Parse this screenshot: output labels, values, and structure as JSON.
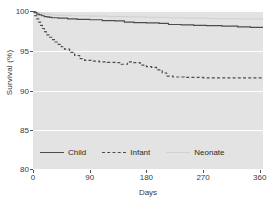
{
  "chart_data": {
    "type": "line",
    "title": "",
    "xlabel": "Days",
    "ylabel": "Survival (%)",
    "xlim": [
      0,
      365
    ],
    "ylim": [
      80,
      100
    ],
    "xticks": [
      0,
      90,
      180,
      270,
      360
    ],
    "yticks": [
      80,
      85,
      90,
      95,
      100
    ],
    "grid": true,
    "legend_position": "inside-bottom-left",
    "series": [
      {
        "name": "Child",
        "style": "solid",
        "color": "#4d4d4d",
        "points": [
          [
            0,
            100.0
          ],
          [
            3,
            99.8
          ],
          [
            6,
            99.6
          ],
          [
            10,
            99.5
          ],
          [
            14,
            99.4
          ],
          [
            18,
            99.3
          ],
          [
            22,
            99.25
          ],
          [
            26,
            99.2
          ],
          [
            30,
            99.15
          ],
          [
            40,
            99.1
          ],
          [
            55,
            99.0
          ],
          [
            70,
            98.95
          ],
          [
            90,
            98.9
          ],
          [
            110,
            98.8
          ],
          [
            130,
            98.75
          ],
          [
            145,
            98.6
          ],
          [
            160,
            98.55
          ],
          [
            180,
            98.5
          ],
          [
            200,
            98.45
          ],
          [
            215,
            98.3
          ],
          [
            235,
            98.25
          ],
          [
            255,
            98.2
          ],
          [
            275,
            98.15
          ],
          [
            300,
            98.1
          ],
          [
            325,
            98.0
          ],
          [
            345,
            97.95
          ],
          [
            365,
            97.9
          ]
        ]
      },
      {
        "name": "Infant",
        "style": "dashed",
        "color": "#4d4d4d",
        "points": [
          [
            0,
            99.9
          ],
          [
            3,
            99.4
          ],
          [
            6,
            99.0
          ],
          [
            9,
            98.6
          ],
          [
            12,
            98.2
          ],
          [
            15,
            97.8
          ],
          [
            18,
            97.4
          ],
          [
            21,
            97.0
          ],
          [
            25,
            96.7
          ],
          [
            30,
            96.4
          ],
          [
            35,
            96.1
          ],
          [
            40,
            95.8
          ],
          [
            45,
            95.5
          ],
          [
            50,
            95.2
          ],
          [
            58,
            94.8
          ],
          [
            66,
            94.4
          ],
          [
            74,
            94.0
          ],
          [
            82,
            93.8
          ],
          [
            92,
            93.7
          ],
          [
            105,
            93.6
          ],
          [
            118,
            93.55
          ],
          [
            130,
            93.5
          ],
          [
            140,
            93.3
          ],
          [
            150,
            93.6
          ],
          [
            160,
            93.5
          ],
          [
            170,
            93.2
          ],
          [
            180,
            93.0
          ],
          [
            188,
            92.9
          ],
          [
            196,
            92.6
          ],
          [
            205,
            92.2
          ],
          [
            212,
            91.8
          ],
          [
            222,
            91.7
          ],
          [
            240,
            91.65
          ],
          [
            270,
            91.6
          ],
          [
            300,
            91.6
          ],
          [
            330,
            91.6
          ],
          [
            365,
            91.6
          ]
        ]
      },
      {
        "name": "Neonate",
        "style": "solid",
        "color": "#d2d2d2",
        "points": [
          [
            0,
            100.0
          ],
          [
            4,
            99.9
          ],
          [
            8,
            99.8
          ],
          [
            14,
            99.7
          ],
          [
            20,
            99.6
          ],
          [
            28,
            99.5
          ],
          [
            40,
            99.45
          ],
          [
            60,
            99.4
          ],
          [
            90,
            99.35
          ],
          [
            120,
            99.3
          ],
          [
            150,
            99.25
          ],
          [
            180,
            99.2
          ],
          [
            210,
            99.15
          ],
          [
            240,
            99.1
          ],
          [
            280,
            99.05
          ],
          [
            320,
            99.0
          ],
          [
            365,
            98.95
          ]
        ]
      }
    ]
  },
  "axes": {
    "ylabel": "Survival (%)",
    "xlabel": "Days",
    "yticks": [
      "100",
      "95",
      "90",
      "85",
      "80"
    ],
    "xticks": [
      "0",
      "90",
      "180",
      "270",
      "360"
    ]
  },
  "legend": {
    "items": [
      {
        "label": "Child"
      },
      {
        "label": "Infant"
      },
      {
        "label": "Neonate"
      }
    ]
  },
  "colors": {
    "plot_background": "#e3e3e3",
    "gridline": "#ffffff",
    "child_line": "#4d4d4d",
    "infant_line": "#4d4d4d",
    "neonate_line": "#d2d2d2",
    "text": "#3a3a3a"
  }
}
